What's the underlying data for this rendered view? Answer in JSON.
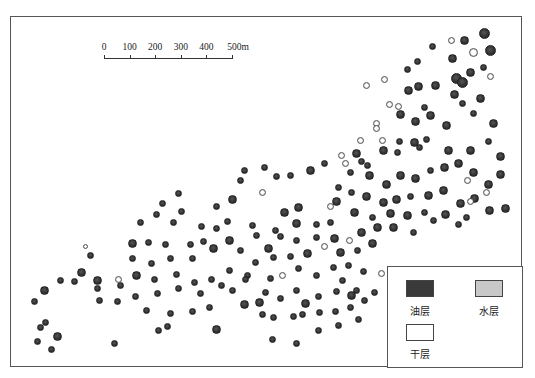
{
  "scale_bar": {
    "labels": [
      "0",
      "100",
      "200",
      "300",
      "400",
      "500m"
    ],
    "unit": "m"
  },
  "legend": {
    "items": [
      {
        "label": "油层",
        "color": "#3a3a3a"
      },
      {
        "label": "水层",
        "color": "#c8c8c8"
      },
      {
        "label": "干层",
        "color": "#ffffff"
      }
    ]
  },
  "colors": {
    "oil": "#3a3a3a",
    "water": "#c8c8c8",
    "dry": "#ffffff",
    "frame": "#555555"
  },
  "wells": [
    [
      484,
      33,
      5,
      "o"
    ],
    [
      464,
      40,
      4,
      "o"
    ],
    [
      451,
      40,
      3,
      "d"
    ],
    [
      490,
      50,
      5,
      "o"
    ],
    [
      432,
      46,
      3,
      "o"
    ],
    [
      473,
      52,
      4,
      "d"
    ],
    [
      452,
      58,
      4,
      "o"
    ],
    [
      483,
      67,
      3,
      "o"
    ],
    [
      470,
      72,
      4,
      "o"
    ],
    [
      456,
      78,
      5,
      "o"
    ],
    [
      490,
      76,
      3,
      "d"
    ],
    [
      462,
      82,
      5,
      "o"
    ],
    [
      417,
      61,
      3,
      "o"
    ],
    [
      407,
      69,
      3,
      "o"
    ],
    [
      366,
      85,
      3,
      "d"
    ],
    [
      384,
      79,
      3,
      "d"
    ],
    [
      408,
      90,
      4,
      "o"
    ],
    [
      418,
      86,
      4,
      "o"
    ],
    [
      435,
      85,
      4,
      "o"
    ],
    [
      454,
      94,
      4,
      "o"
    ],
    [
      480,
      98,
      4,
      "o"
    ],
    [
      389,
      104,
      3,
      "d"
    ],
    [
      398,
      106,
      3,
      "d"
    ],
    [
      424,
      107,
      3,
      "o"
    ],
    [
      462,
      103,
      3,
      "o"
    ],
    [
      400,
      114,
      4,
      "o"
    ],
    [
      430,
      115,
      4,
      "o"
    ],
    [
      473,
      113,
      3,
      "o"
    ],
    [
      415,
      121,
      4,
      "o"
    ],
    [
      446,
      125,
      4,
      "o"
    ],
    [
      493,
      123,
      4,
      "o"
    ],
    [
      376,
      123,
      3,
      "d"
    ],
    [
      376,
      128,
      3,
      "d"
    ],
    [
      360,
      140,
      3,
      "d"
    ],
    [
      382,
      140,
      3,
      "d"
    ],
    [
      399,
      141,
      3,
      "o"
    ],
    [
      414,
      142,
      4,
      "o"
    ],
    [
      426,
      139,
      3,
      "o"
    ],
    [
      448,
      150,
      4,
      "o"
    ],
    [
      470,
      150,
      4,
      "o"
    ],
    [
      500,
      156,
      4,
      "o"
    ],
    [
      488,
      141,
      3,
      "o"
    ],
    [
      419,
      147,
      3,
      "o"
    ],
    [
      397,
      152,
      3,
      "o"
    ],
    [
      383,
      150,
      4,
      "o"
    ],
    [
      356,
      153,
      4,
      "o"
    ],
    [
      361,
      161,
      3,
      "o"
    ],
    [
      367,
      165,
      3,
      "o"
    ],
    [
      345,
      163,
      3,
      "d"
    ],
    [
      341,
      155,
      3,
      "d"
    ],
    [
      324,
      163,
      3,
      "o"
    ],
    [
      310,
      170,
      4,
      "o"
    ],
    [
      290,
      175,
      3,
      "o"
    ],
    [
      276,
      176,
      3,
      "o"
    ],
    [
      264,
      167,
      3,
      "o"
    ],
    [
      244,
      170,
      3,
      "o"
    ],
    [
      240,
      180,
      3,
      "o"
    ],
    [
      262,
      192,
      3,
      "d"
    ],
    [
      232,
      199,
      4,
      "o"
    ],
    [
      350,
      172,
      3,
      "o"
    ],
    [
      369,
      175,
      4,
      "o"
    ],
    [
      386,
      184,
      4,
      "o"
    ],
    [
      400,
      175,
      4,
      "o"
    ],
    [
      415,
      178,
      4,
      "o"
    ],
    [
      430,
      170,
      3,
      "o"
    ],
    [
      444,
      167,
      4,
      "o"
    ],
    [
      458,
      163,
      4,
      "o"
    ],
    [
      473,
      172,
      4,
      "o"
    ],
    [
      488,
      184,
      4,
      "o"
    ],
    [
      500,
      174,
      4,
      "o"
    ],
    [
      467,
      180,
      3,
      "d"
    ],
    [
      443,
      190,
      4,
      "o"
    ],
    [
      428,
      195,
      4,
      "o"
    ],
    [
      410,
      196,
      3,
      "o"
    ],
    [
      396,
      199,
      4,
      "o"
    ],
    [
      383,
      202,
      4,
      "o"
    ],
    [
      366,
      196,
      4,
      "o"
    ],
    [
      351,
      192,
      3,
      "o"
    ],
    [
      338,
      187,
      3,
      "o"
    ],
    [
      330,
      206,
      3,
      "d"
    ],
    [
      336,
      201,
      4,
      "o"
    ],
    [
      354,
      212,
      4,
      "o"
    ],
    [
      372,
      217,
      3,
      "o"
    ],
    [
      390,
      213,
      4,
      "o"
    ],
    [
      407,
      215,
      4,
      "o"
    ],
    [
      424,
      212,
      3,
      "o"
    ],
    [
      445,
      214,
      4,
      "o"
    ],
    [
      460,
      203,
      4,
      "o"
    ],
    [
      474,
      198,
      4,
      "o"
    ],
    [
      489,
      210,
      4,
      "o"
    ],
    [
      505,
      208,
      4,
      "o"
    ],
    [
      458,
      224,
      3,
      "o"
    ],
    [
      433,
      220,
      3,
      "o"
    ],
    [
      466,
      217,
      3,
      "o"
    ],
    [
      470,
      201,
      3,
      "d"
    ],
    [
      486,
      192,
      3,
      "d"
    ],
    [
      330,
      222,
      3,
      "o"
    ],
    [
      316,
      224,
      3,
      "o"
    ],
    [
      296,
      223,
      4,
      "o"
    ],
    [
      284,
      212,
      4,
      "o"
    ],
    [
      298,
      207,
      4,
      "o"
    ],
    [
      275,
      230,
      3,
      "o"
    ],
    [
      252,
      225,
      3,
      "o"
    ],
    [
      227,
      221,
      3,
      "o"
    ],
    [
      201,
      226,
      3,
      "o"
    ],
    [
      173,
      222,
      3,
      "o"
    ],
    [
      156,
      214,
      3,
      "o"
    ],
    [
      140,
      222,
      3,
      "o"
    ],
    [
      181,
      211,
      3,
      "o"
    ],
    [
      162,
      203,
      3,
      "o"
    ],
    [
      178,
      193,
      3,
      "o"
    ],
    [
      216,
      206,
      3,
      "o"
    ],
    [
      216,
      228,
      3,
      "o"
    ],
    [
      203,
      241,
      3,
      "o"
    ],
    [
      190,
      244,
      3,
      "o"
    ],
    [
      165,
      244,
      3,
      "o"
    ],
    [
      148,
      242,
      3,
      "o"
    ],
    [
      132,
      243,
      4,
      "o"
    ],
    [
      132,
      258,
      3,
      "o"
    ],
    [
      151,
      263,
      3,
      "o"
    ],
    [
      170,
      258,
      3,
      "o"
    ],
    [
      192,
      258,
      3,
      "o"
    ],
    [
      213,
      248,
      4,
      "o"
    ],
    [
      229,
      240,
      4,
      "o"
    ],
    [
      240,
      250,
      3,
      "o"
    ],
    [
      256,
      235,
      3,
      "o"
    ],
    [
      268,
      248,
      4,
      "o"
    ],
    [
      280,
      236,
      3,
      "o"
    ],
    [
      296,
      240,
      3,
      "o"
    ],
    [
      316,
      237,
      3,
      "o"
    ],
    [
      334,
      238,
      4,
      "o"
    ],
    [
      349,
      240,
      3,
      "d"
    ],
    [
      361,
      232,
      4,
      "o"
    ],
    [
      377,
      227,
      4,
      "o"
    ],
    [
      393,
      227,
      4,
      "o"
    ],
    [
      413,
      232,
      3,
      "o"
    ],
    [
      372,
      243,
      4,
      "o"
    ],
    [
      357,
      250,
      3,
      "o"
    ],
    [
      340,
      252,
      4,
      "o"
    ],
    [
      324,
      246,
      3,
      "d"
    ],
    [
      307,
      253,
      4,
      "o"
    ],
    [
      290,
      256,
      3,
      "o"
    ],
    [
      273,
      257,
      3,
      "o"
    ],
    [
      255,
      262,
      3,
      "o"
    ],
    [
      247,
      275,
      3,
      "o"
    ],
    [
      229,
      270,
      3,
      "o"
    ],
    [
      211,
      279,
      3,
      "o"
    ],
    [
      194,
      282,
      3,
      "o"
    ],
    [
      176,
      274,
      3,
      "o"
    ],
    [
      154,
      279,
      3,
      "o"
    ],
    [
      136,
      275,
      4,
      "o"
    ],
    [
      120,
      285,
      3,
      "o"
    ],
    [
      117,
      301,
      3,
      "o"
    ],
    [
      135,
      296,
      3,
      "o"
    ],
    [
      157,
      293,
      3,
      "o"
    ],
    [
      178,
      288,
      3,
      "o"
    ],
    [
      200,
      293,
      3,
      "o"
    ],
    [
      221,
      285,
      3,
      "o"
    ],
    [
      245,
      279,
      3,
      "o"
    ],
    [
      270,
      278,
      3,
      "o"
    ],
    [
      282,
      275,
      3,
      "d"
    ],
    [
      298,
      268,
      3,
      "o"
    ],
    [
      316,
      275,
      3,
      "o"
    ],
    [
      333,
      267,
      3,
      "o"
    ],
    [
      348,
      265,
      3,
      "o"
    ],
    [
      363,
      271,
      3,
      "o"
    ],
    [
      381,
      273,
      3,
      "d"
    ],
    [
      351,
      295,
      4,
      "o"
    ],
    [
      336,
      291,
      3,
      "o"
    ],
    [
      318,
      296,
      3,
      "o"
    ],
    [
      305,
      303,
      4,
      "o"
    ],
    [
      296,
      290,
      3,
      "o"
    ],
    [
      280,
      298,
      3,
      "o"
    ],
    [
      265,
      292,
      3,
      "o"
    ],
    [
      259,
      302,
      4,
      "o"
    ],
    [
      244,
      304,
      4,
      "o"
    ],
    [
      232,
      290,
      3,
      "o"
    ],
    [
      209,
      307,
      3,
      "o"
    ],
    [
      192,
      311,
      3,
      "o"
    ],
    [
      170,
      313,
      3,
      "o"
    ],
    [
      146,
      310,
      3,
      "o"
    ],
    [
      167,
      326,
      3,
      "o"
    ],
    [
      216,
      329,
      4,
      "o"
    ],
    [
      158,
      330,
      3,
      "o"
    ],
    [
      262,
      314,
      3,
      "o"
    ],
    [
      273,
      317,
      3,
      "o"
    ],
    [
      293,
      316,
      3,
      "o"
    ],
    [
      302,
      314,
      3,
      "o"
    ],
    [
      319,
      312,
      3,
      "o"
    ],
    [
      335,
      311,
      3,
      "o"
    ],
    [
      350,
      307,
      3,
      "o"
    ],
    [
      364,
      300,
      3,
      "o"
    ],
    [
      374,
      292,
      3,
      "o"
    ],
    [
      272,
      339,
      3,
      "o"
    ],
    [
      296,
      343,
      3,
      "o"
    ],
    [
      318,
      330,
      3,
      "o"
    ],
    [
      338,
      325,
      3,
      "o"
    ],
    [
      358,
      319,
      3,
      "o"
    ],
    [
      356,
      290,
      3,
      "o"
    ],
    [
      342,
      280,
      3,
      "o"
    ],
    [
      97,
      288,
      3,
      "o"
    ],
    [
      97,
      280,
      4,
      "o"
    ],
    [
      81,
      272,
      4,
      "o"
    ],
    [
      74,
      281,
      3,
      "o"
    ],
    [
      90,
      255,
      3,
      "o"
    ],
    [
      85,
      246,
      2,
      "d"
    ],
    [
      60,
      280,
      3,
      "o"
    ],
    [
      44,
      290,
      4,
      "o"
    ],
    [
      34,
      301,
      3,
      "o"
    ],
    [
      40,
      327,
      3,
      "o"
    ],
    [
      45,
      322,
      3,
      "o"
    ],
    [
      37,
      341,
      3,
      "o"
    ],
    [
      57,
      336,
      4,
      "o"
    ],
    [
      51,
      349,
      3,
      "o"
    ],
    [
      114,
      343,
      3,
      "o"
    ],
    [
      118,
      279,
      3,
      "d"
    ],
    [
      99,
      300,
      3,
      "o"
    ]
  ]
}
